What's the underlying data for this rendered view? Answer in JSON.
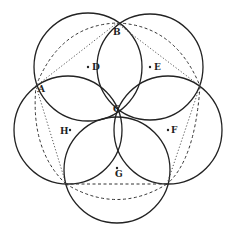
{
  "diagram": {
    "title": "",
    "circles": [
      {
        "label": "D",
        "cx": 88,
        "cy": 67,
        "r": 54
      },
      {
        "label": "E",
        "cx": 150,
        "cy": 67,
        "r": 53
      },
      {
        "label": "F",
        "cx": 168,
        "cy": 130,
        "r": 54
      },
      {
        "label": "G",
        "cx": 117,
        "cy": 170,
        "r": 53
      },
      {
        "label": "H",
        "cx": 68,
        "cy": 130,
        "r": 54
      }
    ],
    "points": {
      "A": {
        "label": "A",
        "x": 36,
        "y": 86
      },
      "B": {
        "label": "B",
        "x": 117,
        "y": 23
      },
      "C": {
        "label": "C",
        "x": 117,
        "y": 110
      },
      "D": {
        "label": "D",
        "x": 88,
        "y": 67
      },
      "E": {
        "label": "E",
        "x": 150,
        "y": 67
      },
      "F": {
        "label": "F",
        "x": 168,
        "y": 130
      },
      "G": {
        "label": "G",
        "x": 117,
        "y": 170
      },
      "H": {
        "label": "H",
        "x": 68,
        "y": 130
      }
    },
    "outer_vertices": [
      [
        36,
        86
      ],
      [
        117,
        23
      ],
      [
        200,
        86
      ],
      [
        167,
        184
      ],
      [
        66,
        184
      ]
    ]
  }
}
